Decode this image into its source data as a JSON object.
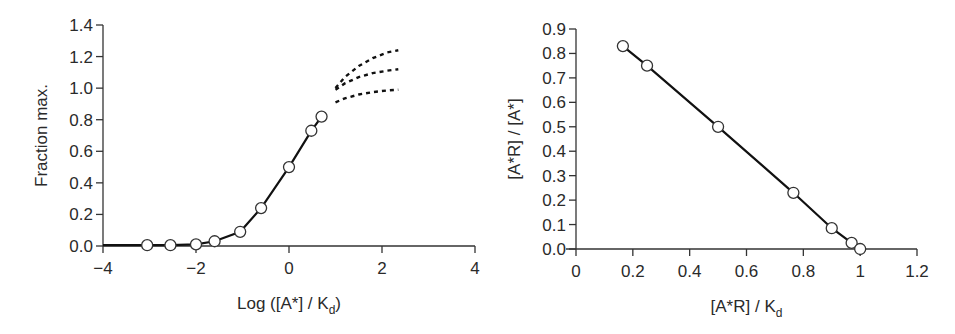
{
  "chart_data": [
    {
      "type": "line",
      "title": "",
      "xlabel": "Log ([A*] / K_d)",
      "xlabel_main": "Log ([A*] / K",
      "xlabel_sub": "d",
      "xlabel_end": ")",
      "ylabel": "Fraction max.",
      "xlim": [
        -4,
        4
      ],
      "ylim": [
        0,
        1.4
      ],
      "xticks": [
        -4,
        -2,
        0,
        2,
        4
      ],
      "xtick_labels": [
        "−4",
        "−2",
        "0",
        "2",
        "4"
      ],
      "yticks": [
        0,
        0.2,
        0.4,
        0.6,
        0.8,
        1.0,
        1.2,
        1.4
      ],
      "ytick_labels": [
        "0.0",
        "0.2",
        "0.4",
        "0.6",
        "0.8",
        "1.0",
        "1.2",
        "1.4"
      ],
      "grid": false,
      "legend": null,
      "series": [
        {
          "name": "measured",
          "style": "solid-with-open-circles",
          "line": {
            "x": [
              -4,
              -3.05,
              -2.55,
              -2.0,
              -1.6,
              -1.05,
              -0.6,
              0,
              0.48,
              0.7
            ],
            "y": [
              0.005,
              0.005,
              0.005,
              0.01,
              0.03,
              0.09,
              0.24,
              0.5,
              0.73,
              0.82
            ]
          },
          "points": {
            "x": [
              -3.05,
              -2.55,
              -2.0,
              -1.6,
              -1.05,
              -0.6,
              0,
              0.48,
              0.7
            ],
            "y": [
              0.005,
              0.005,
              0.01,
              0.03,
              0.09,
              0.24,
              0.5,
              0.73,
              0.82
            ]
          }
        },
        {
          "name": "extrapolation-upper",
          "style": "dashed",
          "x": [
            1.0,
            1.2,
            1.5,
            1.8,
            2.1,
            2.35
          ],
          "y": [
            1.0,
            1.07,
            1.14,
            1.19,
            1.225,
            1.24
          ]
        },
        {
          "name": "extrapolation-middle",
          "style": "dashed",
          "x": [
            1.0,
            1.2,
            1.5,
            1.8,
            2.1,
            2.35
          ],
          "y": [
            0.99,
            1.03,
            1.07,
            1.095,
            1.11,
            1.12
          ]
        },
        {
          "name": "extrapolation-lower",
          "style": "dashed",
          "x": [
            1.0,
            1.2,
            1.5,
            1.8,
            2.1,
            2.35
          ],
          "y": [
            0.91,
            0.935,
            0.96,
            0.975,
            0.985,
            0.99
          ]
        }
      ]
    },
    {
      "type": "line",
      "title": "",
      "xlabel": "[A*R] / K_d",
      "xlabel_main": "[A*R] / K",
      "xlabel_sub": "d",
      "ylabel": "[A*R] / [A*]",
      "xlim": [
        0,
        1.2
      ],
      "ylim": [
        0,
        0.9
      ],
      "xticks": [
        0,
        0.2,
        0.4,
        0.6,
        0.8,
        1.0,
        1.2
      ],
      "xtick_labels": [
        "0",
        "0.2",
        "0.4",
        "0.6",
        "0.8",
        "1",
        "1.2"
      ],
      "yticks": [
        0,
        0.1,
        0.2,
        0.3,
        0.4,
        0.5,
        0.6,
        0.7,
        0.8,
        0.9
      ],
      "ytick_labels": [
        "0.0",
        "0.1",
        "0.2",
        "0.3",
        "0.4",
        "0.5",
        "0.6",
        "0.7",
        "0.8",
        "0.9"
      ],
      "grid": false,
      "legend": null,
      "series": [
        {
          "name": "scatchard",
          "style": "solid-with-open-circles",
          "x": [
            0.165,
            0.25,
            0.5,
            0.765,
            0.9,
            0.97,
            1.0
          ],
          "y": [
            0.83,
            0.75,
            0.5,
            0.23,
            0.085,
            0.025,
            0.0
          ]
        }
      ]
    }
  ]
}
